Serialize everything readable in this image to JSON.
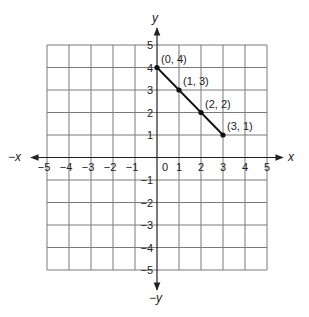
{
  "chart_data": {
    "type": "line",
    "title": "",
    "xlabel": "x",
    "ylabel": "y",
    "xlabel_negative": "−x",
    "ylabel_negative": "−y",
    "xlim": [
      -5,
      5
    ],
    "ylim": [
      -5,
      5
    ],
    "grid": true,
    "x_ticks": [
      "−5",
      "−4",
      "−3",
      "−2",
      "−1",
      "0",
      "1",
      "2",
      "3",
      "4",
      "5"
    ],
    "y_ticks": [
      "5",
      "4",
      "3",
      "2",
      "1",
      "−1",
      "−2",
      "−3",
      "−4",
      "−5"
    ],
    "series": [
      {
        "name": "segment",
        "points": [
          {
            "x": 0,
            "y": 4,
            "label": "(0, 4)"
          },
          {
            "x": 1,
            "y": 3,
            "label": "(1, 3)"
          },
          {
            "x": 2,
            "y": 2,
            "label": "(2, 2)"
          },
          {
            "x": 3,
            "y": 1,
            "label": "(3, 1)"
          }
        ]
      }
    ]
  },
  "colors": {
    "grid": "#7a7a7a",
    "axis": "#222222",
    "line": "#111111"
  }
}
